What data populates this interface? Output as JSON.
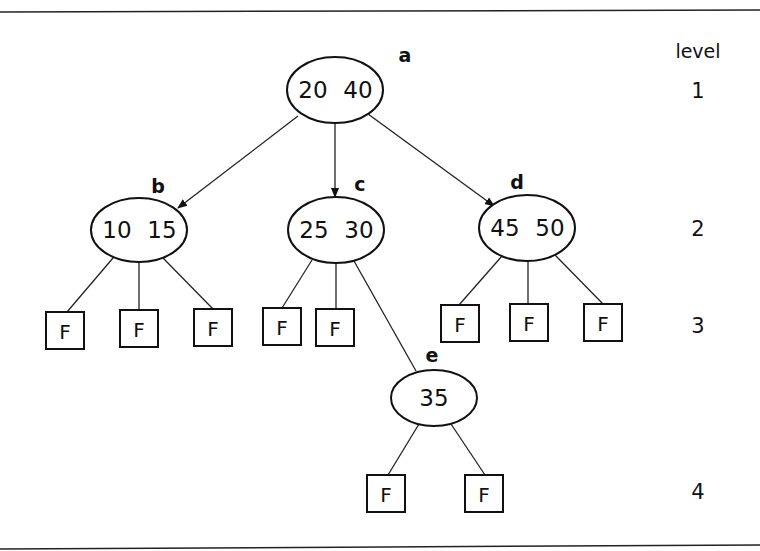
{
  "diagram": {
    "type": "2-3 tree",
    "nodes": [
      {
        "id": "a",
        "label": "a",
        "keys": [
          "20",
          "40"
        ],
        "level": 1,
        "cx": 335,
        "cy": 90,
        "rx": 48,
        "ry": 33,
        "lx": 405,
        "ly": 62
      },
      {
        "id": "b",
        "label": "b",
        "keys": [
          "10",
          "15"
        ],
        "level": 2,
        "cx": 139,
        "cy": 230,
        "rx": 48,
        "ry": 32,
        "lx": 158,
        "ly": 193
      },
      {
        "id": "c",
        "label": "c",
        "keys": [
          "25",
          "30"
        ],
        "level": 2,
        "cx": 336,
        "cy": 230,
        "rx": 48,
        "ry": 33,
        "lx": 360,
        "ly": 191
      },
      {
        "id": "d",
        "label": "d",
        "keys": [
          "45",
          "50"
        ],
        "level": 2,
        "cx": 527,
        "cy": 228,
        "rx": 48,
        "ry": 33,
        "lx": 517,
        "ly": 189
      },
      {
        "id": "e",
        "label": "e",
        "keys": [
          "35"
        ],
        "level": 3,
        "cx": 434,
        "cy": 398,
        "rx": 43,
        "ry": 28,
        "lx": 432,
        "ly": 362
      }
    ],
    "leaves": [
      {
        "label": "F",
        "parent": "b",
        "x": 46,
        "y": 312,
        "ex": 67,
        "ey": 312,
        "px": 113,
        "py": 258
      },
      {
        "label": "F",
        "parent": "b",
        "x": 120,
        "y": 310,
        "ex": 139,
        "ey": 310,
        "px": 139,
        "py": 262
      },
      {
        "label": "F",
        "parent": "b",
        "x": 194,
        "y": 309,
        "ex": 213,
        "ey": 309,
        "px": 163,
        "py": 258
      },
      {
        "label": "F",
        "parent": "c",
        "x": 263,
        "y": 308,
        "ex": 282,
        "ey": 308,
        "px": 312,
        "py": 260
      },
      {
        "label": "F",
        "parent": "c",
        "x": 316,
        "y": 309,
        "ex": 336,
        "ey": 309,
        "px": 336,
        "py": 263
      },
      {
        "label": "F",
        "parent": "d",
        "x": 441,
        "y": 305,
        "ex": 459,
        "ey": 305,
        "px": 502,
        "py": 256
      },
      {
        "label": "F",
        "parent": "d",
        "x": 510,
        "y": 304,
        "ex": 528,
        "ey": 304,
        "px": 528,
        "py": 261
      },
      {
        "label": "F",
        "parent": "d",
        "x": 584,
        "y": 304,
        "ex": 603,
        "ey": 304,
        "px": 555,
        "py": 255
      },
      {
        "label": "F",
        "parent": "e",
        "x": 367,
        "y": 475,
        "ex": 388,
        "ey": 475,
        "px": 419,
        "py": 424
      },
      {
        "label": "F",
        "parent": "e",
        "x": 465,
        "y": 475,
        "ex": 485,
        "ey": 475,
        "px": 451,
        "py": 424
      }
    ],
    "arrows": [
      {
        "from": "a",
        "to": "b",
        "x1": 298,
        "y1": 116,
        "x2": 178,
        "y2": 208
      },
      {
        "from": "a",
        "to": "c",
        "x1": 335,
        "y1": 123,
        "x2": 335,
        "y2": 197
      },
      {
        "from": "a",
        "to": "d",
        "x1": 368,
        "y1": 114,
        "x2": 494,
        "y2": 206
      }
    ],
    "lines": [
      {
        "from": "c",
        "to": "e",
        "x1": 354,
        "y1": 261,
        "x2": 416,
        "y2": 371
      }
    ],
    "level_column": {
      "heading": "level",
      "x": 698,
      "heading_y": 58,
      "levels": [
        {
          "label": "1",
          "y": 98
        },
        {
          "label": "2",
          "y": 236
        },
        {
          "label": "3",
          "y": 333
        },
        {
          "label": "4",
          "y": 499
        }
      ]
    },
    "rules": {
      "top_y": 12,
      "bottom_y": 548
    }
  }
}
